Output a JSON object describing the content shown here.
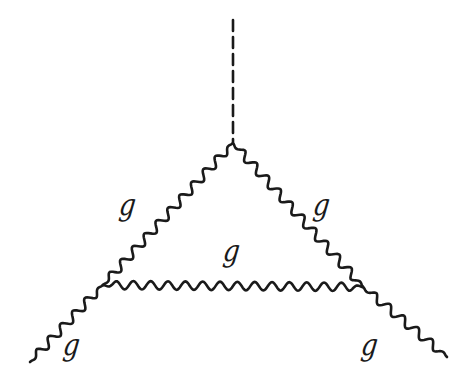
{
  "diagram": {
    "type": "feynman",
    "stroke_color": "#1a1a1a",
    "background": "#ffffff",
    "scalar_line": {
      "label": "",
      "style": "dashed",
      "from": [
        233,
        20
      ],
      "to": [
        233,
        142
      ]
    },
    "vertices": {
      "top": [
        233,
        143
      ],
      "left": [
        103,
        285
      ],
      "right": [
        363,
        287
      ]
    },
    "gluon_lines": [
      {
        "id": "left-internal",
        "from": [
          233,
          143
        ],
        "to": [
          103,
          285
        ],
        "label": "g"
      },
      {
        "id": "right-internal",
        "from": [
          233,
          143
        ],
        "to": [
          363,
          287
        ],
        "label": "g"
      },
      {
        "id": "bottom-internal",
        "from": [
          103,
          285
        ],
        "to": [
          363,
          287
        ],
        "label": "g"
      },
      {
        "id": "left-external",
        "from": [
          103,
          285
        ],
        "to": [
          30,
          362
        ],
        "label": "g"
      },
      {
        "id": "right-external",
        "from": [
          363,
          287
        ],
        "to": [
          447,
          357
        ],
        "label": "g"
      }
    ],
    "labels": [
      {
        "text": "g",
        "x": 118,
        "y": 190
      },
      {
        "text": "g",
        "x": 312,
        "y": 190
      },
      {
        "text": "g",
        "x": 222,
        "y": 236
      },
      {
        "text": "g",
        "x": 62,
        "y": 330
      },
      {
        "text": "g",
        "x": 360,
        "y": 330
      }
    ]
  }
}
